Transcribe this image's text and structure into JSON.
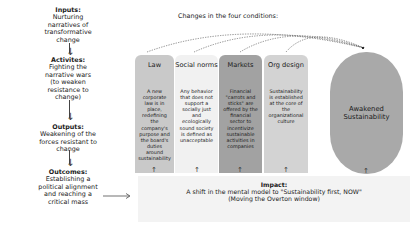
{
  "left_flow": [
    {
      "heading": "Inputs:",
      "text": "Nurturing narratives of transformative change"
    },
    {
      "heading": "Activites:",
      "text": "Fighting the narrative wars (to weaken resistance to change)"
    },
    {
      "heading": "Outputs:",
      "text": "Weakening of the forces resistant to change"
    },
    {
      "heading": "Outcomes:",
      "text": "Establishing a political alignment and reaching a critical mass"
    }
  ],
  "conditions_header": "Changes in the four conditions:",
  "conditions": [
    {
      "title": "Law",
      "desc": "A new corporate law is in place, redefining the company's purpose and the board's duties around sustainability",
      "color": "#c9c9c9"
    },
    {
      "title": "Social norms",
      "desc": "Any behavior that does not support a socially just and ecologically sound society is defined as unacceptable",
      "color": "#f1f1f1"
    },
    {
      "title": "Markets",
      "desc": "Financial \"carrots and sticks\" are offered by the financial sector to incentivize sustainable activities in companies",
      "color": "#a2a2a2"
    },
    {
      "title": "Org design",
      "desc": "Sustainability is established at the core of the organizational culture",
      "color": "#d3d3d3"
    }
  ],
  "goal": {
    "label": "Awakened Sustainability",
    "color": "#a9a9a9"
  },
  "impact": {
    "heading": "Impact:",
    "line1": "A shift in the mental model to \"Sustainability first, NOW\"",
    "line2": "(Moving the Overton window)"
  }
}
